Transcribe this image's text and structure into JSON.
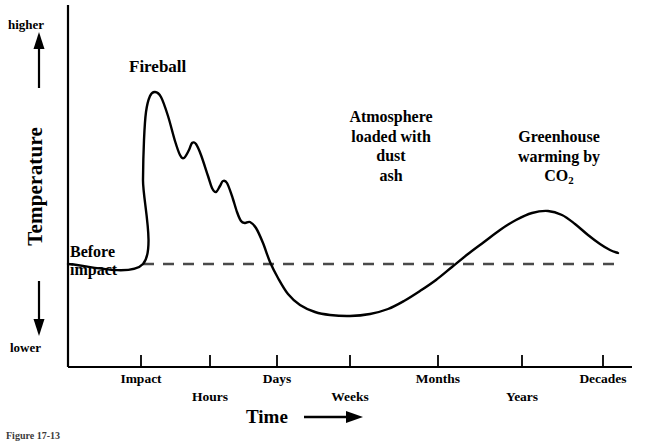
{
  "figure": {
    "caption": "Figure 17-13"
  },
  "axes": {
    "y": {
      "title": "Temperature",
      "high_label": "higher",
      "low_label": "lower",
      "up_arrow_icon": "arrow-up-icon",
      "down_arrow_icon": "arrow-down-icon"
    },
    "x": {
      "title": "Time",
      "arrow_icon": "arrow-right-icon"
    }
  },
  "annotations": {
    "fireball": "Fireball",
    "before_impact_line1": "Before",
    "before_impact_line2": "impact",
    "atmosphere": [
      "Atmosphere",
      "loaded with",
      "dust",
      "ash"
    ],
    "greenhouse": [
      "Greenhouse",
      "warming by"
    ],
    "greenhouse_species_prefix": "CO",
    "greenhouse_species_sub": "2"
  },
  "colors": {
    "curve": "#000000",
    "axis": "#000000",
    "baseline": "#4a4a4a",
    "background": "#ffffff"
  },
  "chart_data": {
    "type": "line",
    "title": "",
    "xlabel": "Time",
    "ylabel": "Temperature",
    "x_axis_type": "logarithmic-ordinal",
    "grid": false,
    "legend": false,
    "tick_labels": [
      "Impact",
      "Hours",
      "Days",
      "Weeks",
      "Months",
      "Years",
      "Decades"
    ],
    "tick_px": [
      141,
      210,
      277,
      350,
      438,
      522,
      603
    ],
    "tick_row": [
      0,
      1,
      0,
      1,
      0,
      1,
      0
    ],
    "baseline_label": "Before impact",
    "baseline_value": 0,
    "ylim": [
      "lower",
      "higher"
    ],
    "series": [
      {
        "name": "Surface temperature after asteroid impact",
        "points_px": [
          [
            68,
            264
          ],
          [
            143,
            264
          ],
          [
            143,
            180
          ],
          [
            144,
            140
          ],
          [
            146,
            112
          ],
          [
            150,
            96
          ],
          [
            155,
            92
          ],
          [
            161,
            97
          ],
          [
            168,
            116
          ],
          [
            175,
            141
          ],
          [
            180,
            155
          ],
          [
            184,
            158
          ],
          [
            189,
            150
          ],
          [
            192,
            143
          ],
          [
            196,
            144
          ],
          [
            201,
            155
          ],
          [
            208,
            176
          ],
          [
            212,
            188
          ],
          [
            216,
            192
          ],
          [
            220,
            186
          ],
          [
            223,
            181
          ],
          [
            227,
            183
          ],
          [
            232,
            196
          ],
          [
            237,
            212
          ],
          [
            241,
            221
          ],
          [
            245,
            223
          ],
          [
            250,
            222
          ],
          [
            256,
            228
          ],
          [
            263,
            243
          ],
          [
            270,
            262
          ],
          [
            278,
            278
          ],
          [
            288,
            294
          ],
          [
            300,
            305
          ],
          [
            315,
            312
          ],
          [
            330,
            315
          ],
          [
            350,
            316
          ],
          [
            370,
            314
          ],
          [
            388,
            309
          ],
          [
            404,
            301
          ],
          [
            420,
            291
          ],
          [
            436,
            280
          ],
          [
            452,
            267
          ],
          [
            468,
            254
          ],
          [
            484,
            242
          ],
          [
            500,
            230
          ],
          [
            516,
            220
          ],
          [
            532,
            213
          ],
          [
            548,
            211
          ],
          [
            562,
            215
          ],
          [
            575,
            224
          ],
          [
            588,
            235
          ],
          [
            600,
            244
          ],
          [
            610,
            250
          ],
          [
            618,
            253
          ]
        ],
        "description": "Sharp fireball spike at impact, decaying oscillations over hours, deep impact-winter cooling minimum over weeks-to-months, then greenhouse warming peak over years before settling near pre-impact temperature by decades."
      }
    ],
    "phases": [
      {
        "name": "Fireball",
        "time": "Impact",
        "effect": "extreme short-lived heating spike"
      },
      {
        "name": "Atmosphere loaded with dust ash",
        "time": "Weeks to Months",
        "effect": "impact winter, temperature far below pre-impact level"
      },
      {
        "name": "Greenhouse warming by CO2",
        "time": "Years",
        "effect": "warming above pre-impact level"
      }
    ]
  }
}
